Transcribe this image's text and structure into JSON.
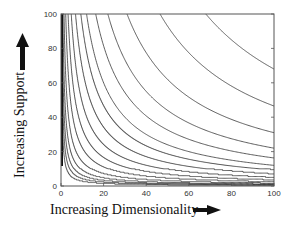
{
  "chart_data": {
    "type": "line",
    "subtype": "contour",
    "title": "",
    "xlabel": "Increasing Dimensionality",
    "ylabel": "Increasing Support",
    "xlim": [
      0,
      100
    ],
    "ylim": [
      0,
      100
    ],
    "x_ticks": [
      0,
      20,
      40,
      60,
      80,
      100
    ],
    "y_ticks": [
      0,
      20,
      40,
      60,
      80,
      100
    ],
    "grid": false,
    "legend": null,
    "series": [
      {
        "name": "contour-1",
        "constant": 6800,
        "y_at_x100": 68
      },
      {
        "name": "contour-2",
        "constant": 4650,
        "y_at_x100": 46.5
      },
      {
        "name": "contour-3",
        "constant": 3100,
        "y_at_x100": 31
      },
      {
        "name": "contour-4",
        "constant": 2200,
        "y_at_x100": 22
      },
      {
        "name": "contour-5",
        "constant": 1630,
        "y_at_x100": 16.3
      },
      {
        "name": "contour-6",
        "constant": 1200,
        "y_at_x100": 12
      },
      {
        "name": "contour-7",
        "constant": 930,
        "y_at_x100": 9.3
      },
      {
        "name": "contour-8",
        "constant": 680,
        "y_at_x100": 6.8
      },
      {
        "name": "contour-9",
        "constant": 480,
        "y_at_x100": 4.8
      },
      {
        "name": "contour-10",
        "constant": 330,
        "y_at_x100": 3.3
      },
      {
        "name": "contour-11",
        "constant": 220,
        "y_at_x100": 2.2
      },
      {
        "name": "contour-12",
        "constant": 140,
        "y_at_x100": 1.4
      },
      {
        "name": "contour-13",
        "constant": 90,
        "y_at_x100": 0.9
      },
      {
        "name": "contour-14",
        "constant": 60,
        "y_at_x100": 0.6
      },
      {
        "name": "contour-15",
        "constant": 40,
        "y_at_x100": 0.4
      },
      {
        "name": "contour-16",
        "constant": 25,
        "y_at_x100": 0.25
      }
    ],
    "arrows": {
      "y_axis": "up",
      "x_axis": "right"
    }
  },
  "plot": {
    "left": 61,
    "top": 14,
    "right": 274,
    "bottom": 186,
    "line_color": "#333333",
    "frame_color": "#555555"
  },
  "labels": {
    "ylabel": "Increasing Support",
    "xlabel": "Increasing Dimensionality"
  }
}
